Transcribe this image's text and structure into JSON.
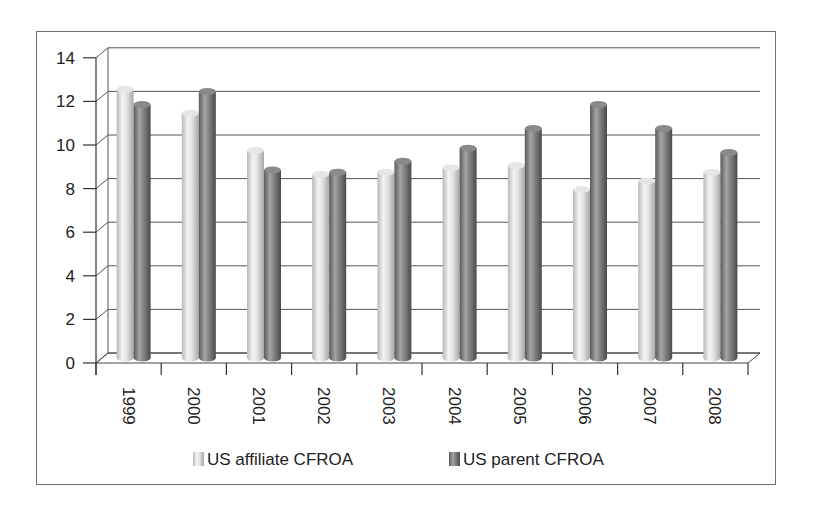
{
  "chart_data": {
    "type": "bar",
    "style": "3d-clustered-cylinder",
    "title": "",
    "xlabel": "",
    "ylabel": "",
    "categories": [
      "1999",
      "2000",
      "2001",
      "2002",
      "2003",
      "2004",
      "2005",
      "2006",
      "2007",
      "2008"
    ],
    "series": [
      {
        "name": "US affiliate CFROA",
        "color": "#d9d9d9",
        "values": [
          12.6,
          11.5,
          9.8,
          8.7,
          8.8,
          9.0,
          9.1,
          8.0,
          8.4,
          8.8
        ]
      },
      {
        "name": "US parent CFROA",
        "color": "#7a7a7a",
        "values": [
          11.9,
          12.5,
          8.9,
          8.8,
          9.3,
          9.9,
          10.8,
          11.9,
          10.8,
          9.7
        ]
      }
    ],
    "yticks": [
      "0",
      "2",
      "4",
      "6",
      "8",
      "10",
      "12",
      "14"
    ],
    "ylim": [
      0,
      14
    ],
    "grid": true,
    "legend_position": "bottom"
  },
  "legend": {
    "items": [
      {
        "label": "US affiliate CFROA"
      },
      {
        "label": "US parent CFROA"
      }
    ]
  }
}
